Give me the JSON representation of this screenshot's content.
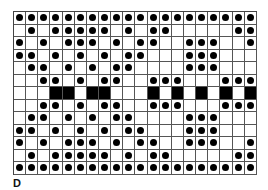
{
  "figure": {
    "label": "D",
    "cols": 20,
    "rows": 13,
    "colors": {
      "dot": "#000000",
      "block": "#000000",
      "grid": "#555555",
      "background": "#ffffff"
    },
    "legend_cell_types": {
      "0": "empty",
      "1": "dot",
      "2": "black-square"
    },
    "grid": [
      [
        1,
        1,
        1,
        1,
        1,
        1,
        1,
        1,
        1,
        1,
        1,
        1,
        1,
        1,
        1,
        1,
        1,
        1,
        1,
        1
      ],
      [
        0,
        1,
        0,
        1,
        1,
        1,
        1,
        1,
        0,
        1,
        0,
        1,
        1,
        0,
        0,
        0,
        0,
        0,
        1,
        1
      ],
      [
        1,
        0,
        1,
        0,
        1,
        1,
        1,
        0,
        1,
        0,
        1,
        1,
        0,
        0,
        1,
        1,
        1,
        0,
        0,
        1
      ],
      [
        1,
        1,
        0,
        1,
        0,
        1,
        0,
        1,
        0,
        1,
        1,
        0,
        0,
        0,
        1,
        1,
        1,
        0,
        0,
        0
      ],
      [
        0,
        1,
        1,
        0,
        1,
        0,
        1,
        0,
        1,
        1,
        0,
        0,
        0,
        0,
        1,
        1,
        1,
        0,
        0,
        0
      ],
      [
        0,
        0,
        1,
        1,
        0,
        1,
        0,
        1,
        1,
        0,
        0,
        1,
        1,
        1,
        0,
        0,
        0,
        1,
        1,
        1
      ],
      [
        0,
        0,
        0,
        2,
        2,
        0,
        2,
        2,
        0,
        0,
        0,
        2,
        0,
        2,
        0,
        2,
        0,
        2,
        0,
        2
      ],
      [
        0,
        0,
        1,
        1,
        0,
        1,
        0,
        1,
        1,
        0,
        0,
        1,
        1,
        1,
        0,
        0,
        0,
        1,
        1,
        1
      ],
      [
        0,
        1,
        1,
        0,
        1,
        0,
        1,
        0,
        1,
        1,
        0,
        0,
        0,
        0,
        1,
        1,
        1,
        0,
        0,
        0
      ],
      [
        1,
        1,
        0,
        1,
        0,
        1,
        0,
        1,
        0,
        1,
        1,
        0,
        0,
        0,
        1,
        1,
        1,
        0,
        0,
        0
      ],
      [
        1,
        0,
        1,
        0,
        1,
        1,
        1,
        0,
        1,
        0,
        1,
        1,
        0,
        0,
        1,
        1,
        1,
        0,
        0,
        1
      ],
      [
        0,
        1,
        0,
        1,
        1,
        1,
        1,
        1,
        0,
        1,
        0,
        1,
        1,
        0,
        0,
        0,
        0,
        0,
        1,
        1
      ],
      [
        1,
        1,
        1,
        1,
        1,
        1,
        1,
        1,
        1,
        1,
        1,
        1,
        1,
        1,
        1,
        1,
        1,
        1,
        1,
        1
      ]
    ]
  }
}
